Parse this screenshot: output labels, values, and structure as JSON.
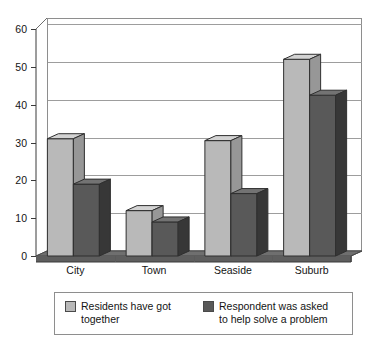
{
  "chart_data": {
    "type": "bar",
    "title": "",
    "subtitle": "",
    "xlabel": "",
    "ylabel": "",
    "ylim": [
      0,
      60
    ],
    "yticks": [
      0,
      10,
      20,
      30,
      40,
      50,
      60
    ],
    "ytick_labels": [
      "0",
      "10",
      "20",
      "30",
      "40",
      "50",
      "60"
    ],
    "grid": true,
    "grid_axis": "y",
    "legend_position": "bottom",
    "style": "3d-column",
    "categories": [
      "City",
      "Town",
      "Seaside",
      "Suburb"
    ],
    "series": [
      {
        "name": "Residents have got together",
        "legend_label": "Residents have got\ntogether",
        "color": "#b9b9b9",
        "values": [
          31,
          12,
          30.5,
          52
        ]
      },
      {
        "name": "Respondent was asked to help solve a problem",
        "legend_label": "Respondent was asked\nto help solve a problem",
        "color": "#595959",
        "values": [
          19,
          9,
          16.5,
          42.5
        ]
      }
    ]
  },
  "axes": {
    "y_ticks": [
      {
        "label": "60",
        "value": 60
      },
      {
        "label": "50",
        "value": 50
      },
      {
        "label": "40",
        "value": 40
      },
      {
        "label": "30",
        "value": 30
      },
      {
        "label": "20",
        "value": 20
      },
      {
        "label": "10",
        "value": 10
      },
      {
        "label": "0",
        "value": 0
      }
    ],
    "x_categories": [
      {
        "label": "City"
      },
      {
        "label": "Town"
      },
      {
        "label": "Seaside"
      },
      {
        "label": "Suburb"
      }
    ]
  },
  "legend": {
    "items": [
      {
        "label": "Residents have got\ntogether",
        "color": "#b9b9b9"
      },
      {
        "label": "Respondent was asked\nto help solve a problem",
        "color": "#595959"
      }
    ]
  },
  "colors": {
    "series_light": "#b9b9b9",
    "series_dark": "#595959",
    "gridline": "#9d9d9d",
    "axis": "#3a3a3a",
    "plot_border": "#8e8e8e",
    "floor": "#6f6f6f",
    "text": "#141414"
  }
}
